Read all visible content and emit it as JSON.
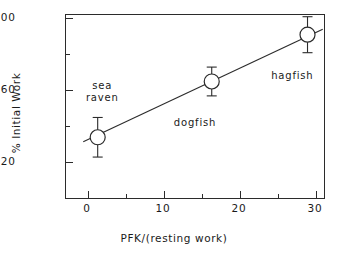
{
  "chart_data": {
    "type": "scatter",
    "title": "",
    "xlabel": "PFK/(resting work)",
    "ylabel": "% Initial Work",
    "xlim": [
      -2.9,
      31.3
    ],
    "ylim": [
      -1.3,
      101.5
    ],
    "grid": false,
    "legend": "none",
    "x_ticks": [
      {
        "value": 0,
        "label": "0",
        "kind": "major"
      },
      {
        "value": 5,
        "label": "",
        "kind": "minor"
      },
      {
        "value": 10,
        "label": "10",
        "kind": "major"
      },
      {
        "value": 15,
        "label": "",
        "kind": "minor"
      },
      {
        "value": 20,
        "label": "20",
        "kind": "major"
      },
      {
        "value": 25,
        "label": "",
        "kind": "minor"
      },
      {
        "value": 30,
        "label": "30",
        "kind": "major"
      }
    ],
    "y_ticks": [
      {
        "value": 20,
        "label": "20",
        "kind": "major"
      },
      {
        "value": 40,
        "label": "",
        "kind": "minor"
      },
      {
        "value": 60,
        "label": "60",
        "kind": "major"
      },
      {
        "value": 80,
        "label": "",
        "kind": "minor"
      },
      {
        "value": 100,
        "label": "100",
        "kind": "major"
      }
    ],
    "marker": "open-circle",
    "error_bars": "vertical",
    "points": [
      {
        "name": "sea raven",
        "x": 1.4,
        "y": 33,
        "yerr": 11,
        "label": "sea\nraven",
        "label_x": 2.0,
        "label_y": 58
      },
      {
        "name": "dogfish",
        "x": 16.4,
        "y": 64,
        "yerr": 8,
        "label": "dogfish",
        "label_x": 14.2,
        "label_y": 41
      },
      {
        "name": "hagfish",
        "x": 29.0,
        "y": 90,
        "yerr": 10,
        "label": "hagfish",
        "label_x": 27.0,
        "label_y": 67
      }
    ],
    "fit_line": {
      "type": "linear",
      "x_start": -0.5,
      "y_start": 30.5,
      "x_end": 31.0,
      "y_end": 93.0
    }
  },
  "colors": {
    "axis": "#2b2b2b",
    "marker": "#2b2b2b",
    "line": "#2b2b2b",
    "text": "#1a1a1a",
    "background": "#ffffff"
  }
}
